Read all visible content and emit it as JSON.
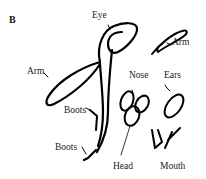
{
  "panel_label": "B",
  "labels": {
    "eye": "Eye",
    "arm_left": "Arm",
    "arm_right": "Arm",
    "nose": "Nose",
    "ears": "Ears",
    "boots_upper": "Boots",
    "boots_lower": "Boots",
    "head": "Head",
    "mouth": "Mouth"
  },
  "colors": {
    "stroke": "#000000",
    "text": "#1a1a1a",
    "background": "#ffffff"
  }
}
